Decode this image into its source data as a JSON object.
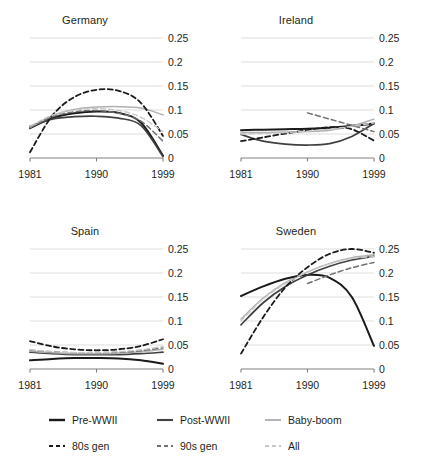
{
  "figure": {
    "background": "#ffffff",
    "grid": true,
    "grid_color": "#d9d9d9",
    "axis_color": "#808080"
  },
  "legend": {
    "position": "bottom",
    "rows": [
      [
        {
          "label": "Pre-WWII",
          "style": "solid",
          "color": "#1a1a1a",
          "width": 2.0
        },
        {
          "label": "Post-WWII",
          "style": "solid",
          "color": "#404040",
          "width": 1.7
        },
        {
          "label": "Baby-boom",
          "style": "solid",
          "color": "#b0b0b0",
          "width": 1.5
        }
      ],
      [
        {
          "label": "80s gen",
          "style": "dashed",
          "color": "#1a1a1a",
          "width": 1.8
        },
        {
          "label": "90s gen",
          "style": "dashed",
          "color": "#707070",
          "width": 1.5
        },
        {
          "label": "All",
          "style": "dashed",
          "color": "#c8c8c8",
          "width": 1.4
        }
      ]
    ]
  },
  "chart_data": [
    {
      "type": "line",
      "title": "Germany",
      "xlabel": "",
      "ylabel": "",
      "xlim": [
        1981,
        1999
      ],
      "ylim": [
        0,
        0.25
      ],
      "xticks": [
        1981,
        1990,
        1999
      ],
      "xticklabels": [
        "1981",
        "1990",
        "1999"
      ],
      "yticks": [
        0,
        0.05,
        0.1,
        0.15,
        0.2,
        0.25
      ],
      "yticklabels": [
        "0",
        "0.05",
        "0.1",
        "0.15",
        "0.2",
        "0.25"
      ],
      "x": [
        1981,
        1984,
        1987,
        1990,
        1993,
        1996,
        1999
      ],
      "series": [
        {
          "name": "Pre-WWII",
          "values": [
            0.062,
            0.083,
            0.093,
            0.097,
            0.094,
            0.074,
            0.005
          ]
        },
        {
          "name": "Post-WWII",
          "values": [
            0.066,
            0.081,
            0.086,
            0.087,
            0.083,
            0.068,
            0.003
          ]
        },
        {
          "name": "Baby-boom",
          "values": [
            0.063,
            0.088,
            0.101,
            0.106,
            0.107,
            0.104,
            0.09
          ]
        },
        {
          "name": "80s gen",
          "values": [
            0.012,
            0.088,
            0.127,
            0.142,
            0.14,
            0.115,
            0.046
          ]
        },
        {
          "name": "90s gen",
          "values": [
            0.064,
            0.086,
            0.096,
            0.099,
            0.093,
            0.077,
            0.035
          ]
        },
        {
          "name": "All",
          "values": [
            0.066,
            0.089,
            0.1,
            0.103,
            0.099,
            0.085,
            0.055
          ]
        }
      ]
    },
    {
      "type": "line",
      "title": "Ireland",
      "xlabel": "",
      "ylabel": "",
      "xlim": [
        1981,
        1999
      ],
      "ylim": [
        0,
        0.25
      ],
      "xticks": [
        1981,
        1990,
        1999
      ],
      "xticklabels": [
        "1981",
        "1990",
        "1999"
      ],
      "yticks": [
        0,
        0.05,
        0.1,
        0.15,
        0.2,
        0.25
      ],
      "yticklabels": [
        "0",
        "0.05",
        "0.1",
        "0.15",
        "0.2",
        "0.25"
      ],
      "x": [
        1981,
        1984,
        1987,
        1990,
        1993,
        1996,
        1999
      ],
      "series": [
        {
          "name": "Pre-WWII",
          "values": [
            0.058,
            0.059,
            0.06,
            0.061,
            0.063,
            0.067,
            0.072
          ]
        },
        {
          "name": "Post-WWII",
          "values": [
            0.049,
            0.035,
            0.029,
            0.027,
            0.03,
            0.045,
            0.072
          ]
        },
        {
          "name": "Baby-boom",
          "values": [
            0.053,
            0.053,
            0.054,
            0.055,
            0.058,
            0.066,
            0.081
          ]
        },
        {
          "name": "80s gen",
          "values": [
            0.035,
            0.043,
            0.051,
            0.058,
            0.064,
            0.06,
            0.036
          ]
        },
        {
          "name": "90s gen",
          "values": [
            null,
            null,
            null,
            0.094,
            0.081,
            0.068,
            0.055
          ]
        },
        {
          "name": "All",
          "values": [
            0.05,
            0.051,
            0.053,
            0.056,
            0.06,
            0.066,
            0.073
          ]
        }
      ]
    },
    {
      "type": "line",
      "title": "Spain",
      "xlabel": "",
      "ylabel": "",
      "xlim": [
        1981,
        1999
      ],
      "ylim": [
        0,
        0.25
      ],
      "xticks": [
        1981,
        1990,
        1999
      ],
      "xticklabels": [
        "1981",
        "1990",
        "1999"
      ],
      "yticks": [
        0,
        0.05,
        0.1,
        0.15,
        0.2,
        0.25
      ],
      "yticklabels": [
        "0",
        "0.05",
        "0.1",
        "0.15",
        "0.2",
        "0.25"
      ],
      "x": [
        1981,
        1984,
        1987,
        1990,
        1993,
        1996,
        1999
      ],
      "series": [
        {
          "name": "Pre-WWII",
          "values": [
            0.018,
            0.021,
            0.023,
            0.023,
            0.022,
            0.018,
            0.011
          ]
        },
        {
          "name": "Post-WWII",
          "values": [
            0.035,
            0.032,
            0.03,
            0.03,
            0.03,
            0.032,
            0.035
          ]
        },
        {
          "name": "Baby-boom",
          "values": [
            0.037,
            0.034,
            0.032,
            0.032,
            0.033,
            0.036,
            0.041
          ]
        },
        {
          "name": "80s gen",
          "values": [
            0.058,
            0.047,
            0.041,
            0.039,
            0.041,
            0.048,
            0.062
          ]
        },
        {
          "name": "90s gen",
          "values": [
            0.039,
            0.036,
            0.034,
            0.034,
            0.035,
            0.038,
            0.044
          ]
        },
        {
          "name": "All",
          "values": [
            0.04,
            0.036,
            0.034,
            0.034,
            0.036,
            0.04,
            0.047
          ]
        }
      ]
    },
    {
      "type": "line",
      "title": "Sweden",
      "xlabel": "",
      "ylabel": "",
      "xlim": [
        1981,
        1999
      ],
      "ylim": [
        0,
        0.25
      ],
      "xticks": [
        1981,
        1990,
        1999
      ],
      "xticklabels": [
        "1981",
        "1990",
        "1999"
      ],
      "yticks": [
        0,
        0.05,
        0.1,
        0.15,
        0.2,
        0.25
      ],
      "yticklabels": [
        "0",
        "0.05",
        "0.1",
        "0.15",
        "0.2",
        "0.25"
      ],
      "x": [
        1981,
        1984,
        1987,
        1990,
        1993,
        1996,
        1999
      ],
      "series": [
        {
          "name": "Pre-WWII",
          "values": [
            0.152,
            0.172,
            0.188,
            0.196,
            0.19,
            0.15,
            0.048
          ]
        },
        {
          "name": "Post-WWII",
          "values": [
            0.092,
            0.138,
            0.172,
            0.196,
            0.214,
            0.227,
            0.235
          ]
        },
        {
          "name": "Baby-boom",
          "values": [
            0.104,
            0.148,
            0.18,
            0.202,
            0.22,
            0.232,
            0.238
          ]
        },
        {
          "name": "80s gen",
          "values": [
            0.032,
            0.108,
            0.17,
            0.212,
            0.24,
            0.25,
            0.242
          ]
        },
        {
          "name": "90s gen",
          "values": [
            null,
            null,
            null,
            0.178,
            0.196,
            0.211,
            0.222
          ]
        },
        {
          "name": "All",
          "values": [
            0.1,
            0.146,
            0.178,
            0.202,
            0.219,
            0.23,
            0.234
          ]
        }
      ]
    }
  ]
}
